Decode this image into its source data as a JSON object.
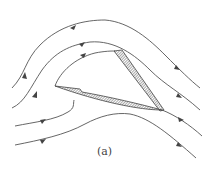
{
  "figure": {
    "caption": "(a)",
    "colors": {
      "line": "#555555",
      "hatch": "#666666",
      "background": "#ffffff"
    },
    "streamlines": [
      {
        "name": "outer-top",
        "arrows": 2
      },
      {
        "name": "inner-top",
        "arrows": 2
      },
      {
        "name": "separating",
        "arrows": 2
      },
      {
        "name": "bottom",
        "arrows": 2
      }
    ]
  }
}
